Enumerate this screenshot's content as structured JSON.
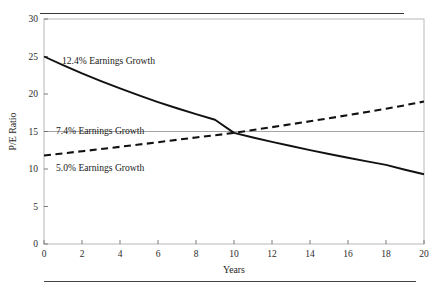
{
  "chart_data": {
    "type": "line",
    "title": "",
    "xlabel": "Years",
    "ylabel": "P/E Ratio",
    "xlim": [
      0,
      20
    ],
    "ylim": [
      0,
      30
    ],
    "xticks": [
      0,
      2,
      4,
      6,
      8,
      10,
      12,
      14,
      16,
      18,
      20
    ],
    "yticks": [
      0,
      5,
      10,
      15,
      20,
      25,
      30
    ],
    "grid": "horizontal-at-15-only",
    "legend_position": "inline-annotations",
    "gridline_values": [
      15
    ],
    "x": [
      0,
      1,
      2,
      3,
      4,
      5,
      6,
      7,
      8,
      9,
      10,
      11,
      12,
      13,
      14,
      15,
      16,
      17,
      18,
      19,
      20
    ],
    "series": [
      {
        "name": "12.4% Earnings Growth",
        "style": "solid",
        "color": "#111111",
        "values": [
          25.0,
          23.85,
          22.75,
          21.72,
          20.74,
          19.81,
          18.93,
          18.1,
          17.31,
          16.57,
          14.82,
          14.2,
          13.62,
          13.06,
          12.52,
          12.0,
          11.5,
          11.02,
          10.55,
          9.9,
          9.3
        ]
      },
      {
        "name": "5.0% Earnings Growth",
        "style": "dashed",
        "color": "#111111",
        "values": [
          11.8,
          12.08,
          12.37,
          12.66,
          12.96,
          13.26,
          13.57,
          13.89,
          14.21,
          14.5,
          14.82,
          15.2,
          15.58,
          15.97,
          16.36,
          16.77,
          17.18,
          17.6,
          18.03,
          18.5,
          19.0
        ]
      }
    ],
    "annotations": [
      {
        "text": "12.4% Earnings Growth",
        "x_px": 62,
        "y_px": 64
      },
      {
        "text": "7.4% Earnings Growth",
        "x_px": 56,
        "y_px": 134
      },
      {
        "text": "5.0% Earnings Growth",
        "x_px": 56,
        "y_px": 171
      }
    ]
  }
}
